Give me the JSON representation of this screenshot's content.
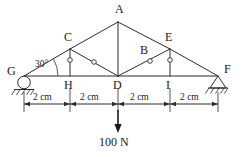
{
  "diagram": {
    "angle_label": "30°",
    "load_label": "100 N",
    "stroke_color": "#2b2b2b",
    "nodes": [
      {
        "id": "A",
        "label": "A",
        "x": 118,
        "y": 22,
        "label_x": 115,
        "label_y": 3
      },
      {
        "id": "C",
        "label": "C",
        "x": 70,
        "y": 49,
        "label_x": 64,
        "label_y": 31
      },
      {
        "id": "E",
        "label": "E",
        "x": 170,
        "y": 49,
        "label_x": 165,
        "label_y": 31
      },
      {
        "id": "B",
        "label": "B",
        "x": 150,
        "y": 61,
        "label_x": 140,
        "label_y": 44
      },
      {
        "id": "G",
        "label": "G",
        "x": 24,
        "y": 76,
        "label_x": 7,
        "label_y": 65
      },
      {
        "id": "H",
        "label": "H",
        "x": 70,
        "y": 76,
        "label_x": 64,
        "label_y": 79
      },
      {
        "id": "D",
        "label": "D",
        "x": 118,
        "y": 76,
        "label_x": 113,
        "label_y": 79
      },
      {
        "id": "I",
        "label": "I",
        "x": 170,
        "y": 76,
        "label_x": 166,
        "label_y": 79
      },
      {
        "id": "F",
        "label": "F",
        "x": 218,
        "y": 76,
        "label_x": 224,
        "label_y": 63
      }
    ],
    "members": [
      {
        "from": "G",
        "to": "C"
      },
      {
        "from": "C",
        "to": "A"
      },
      {
        "from": "A",
        "to": "E"
      },
      {
        "from": "E",
        "to": "F"
      },
      {
        "from": "G",
        "to": "F"
      },
      {
        "from": "A",
        "to": "D"
      },
      {
        "from": "C",
        "to": "H"
      },
      {
        "from": "E",
        "to": "I"
      },
      {
        "from": "C",
        "to": "D"
      },
      {
        "from": "D",
        "to": "E"
      }
    ],
    "pin_joints": [
      {
        "x": 70,
        "y": 60
      },
      {
        "x": 94,
        "y": 62
      },
      {
        "x": 150,
        "y": 61
      },
      {
        "x": 170,
        "y": 60
      }
    ],
    "supports": [
      {
        "node": "G",
        "type": "roller"
      },
      {
        "node": "F",
        "type": "pinned"
      }
    ],
    "dimensions": {
      "line_y": 104,
      "ticks": [
        24,
        70,
        118,
        170,
        218
      ],
      "segments": [
        {
          "label": "2 cm",
          "center_x": 47,
          "label_y": 96
        },
        {
          "label": "2 cm",
          "center_x": 94,
          "label_y": 96
        },
        {
          "label": "2 cm",
          "center_x": 144,
          "label_y": 96
        },
        {
          "label": "2 cm",
          "center_x": 194,
          "label_y": 96
        }
      ]
    },
    "load": {
      "node": "D",
      "x": 118,
      "arrow_top_y": 110,
      "arrow_bottom_y": 131,
      "label": "100 N",
      "label_x": 99,
      "label_y": 136
    }
  }
}
